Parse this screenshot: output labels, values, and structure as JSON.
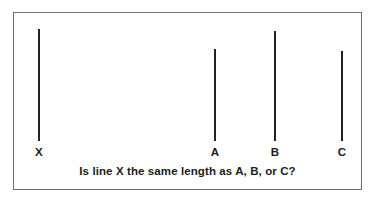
{
  "card": {
    "border_color": "#6e6e6e",
    "background_color": "#ffffff"
  },
  "stimulus": {
    "line_color": "#232323",
    "baseline_y": 128,
    "lines": [
      {
        "id": "X",
        "label": "X",
        "role": "standard",
        "x": 24,
        "top": 16,
        "length": 112
      },
      {
        "id": "A",
        "label": "A",
        "role": "comparison",
        "x": 200,
        "top": 36,
        "length": 92
      },
      {
        "id": "B",
        "label": "B",
        "role": "comparison",
        "x": 260,
        "top": 18,
        "length": 110
      },
      {
        "id": "C",
        "label": "C",
        "role": "comparison",
        "x": 327,
        "top": 38,
        "length": 90
      }
    ]
  },
  "caption": {
    "text": "Is line X the same length as A, B, or C?"
  }
}
